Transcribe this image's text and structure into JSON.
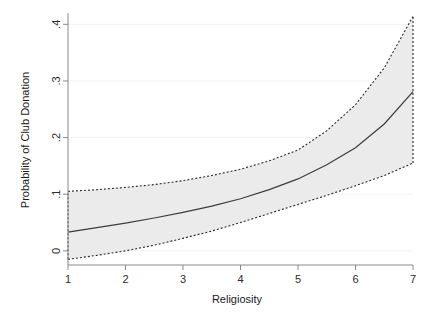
{
  "chart_data": {
    "type": "line",
    "title": "",
    "subtitle": "",
    "xlabel": "Religiosity",
    "ylabel": "Probability of Club Donation",
    "xlim": [
      1,
      7
    ],
    "ylim": [
      -0.025,
      0.42
    ],
    "xticks": [
      1,
      2,
      3,
      4,
      5,
      6,
      7
    ],
    "xticklabels": [
      "1",
      "2",
      "3",
      "4",
      "5",
      "6",
      "7"
    ],
    "yticks": [
      0,
      0.1,
      0.2,
      0.3,
      0.4
    ],
    "yticklabels": [
      "0",
      ".1",
      ".2",
      ".3",
      ".4"
    ],
    "grid": true,
    "grid_axis": "y",
    "legend": "none",
    "annotations": [],
    "x": [
      1,
      1.5,
      2,
      2.5,
      3,
      3.5,
      4,
      4.5,
      5,
      5.5,
      6,
      6.5,
      7
    ],
    "series": [
      {
        "name": "Predicted probability",
        "style": "solid",
        "color": "#3c3c3c",
        "values": [
          0.033,
          0.041,
          0.049,
          0.058,
          0.068,
          0.079,
          0.092,
          0.108,
          0.127,
          0.152,
          0.182,
          0.224,
          0.281
        ]
      },
      {
        "name": "Upper 95% confidence bound",
        "style": "dashed",
        "color": "#2b2b2b",
        "values": [
          0.105,
          0.108,
          0.112,
          0.117,
          0.124,
          0.133,
          0.144,
          0.159,
          0.178,
          0.212,
          0.258,
          0.323,
          0.414
        ]
      },
      {
        "name": "Lower 95% confidence bound",
        "style": "dashed",
        "color": "#2b2b2b",
        "values": [
          -0.015,
          -0.008,
          0.0,
          0.01,
          0.022,
          0.035,
          0.05,
          0.066,
          0.082,
          0.098,
          0.115,
          0.133,
          0.155
        ]
      }
    ],
    "band": {
      "name": "95% confidence interval",
      "fill": "#ebebeb",
      "lower_series": "Lower 95% confidence bound",
      "upper_series": "Upper 95% confidence bound"
    },
    "colors": {
      "axis": "#808080",
      "grid": "#f2f2f2",
      "band_fill": "#ebebeb",
      "line": "#3c3c3c",
      "background": "#ffffff"
    }
  }
}
